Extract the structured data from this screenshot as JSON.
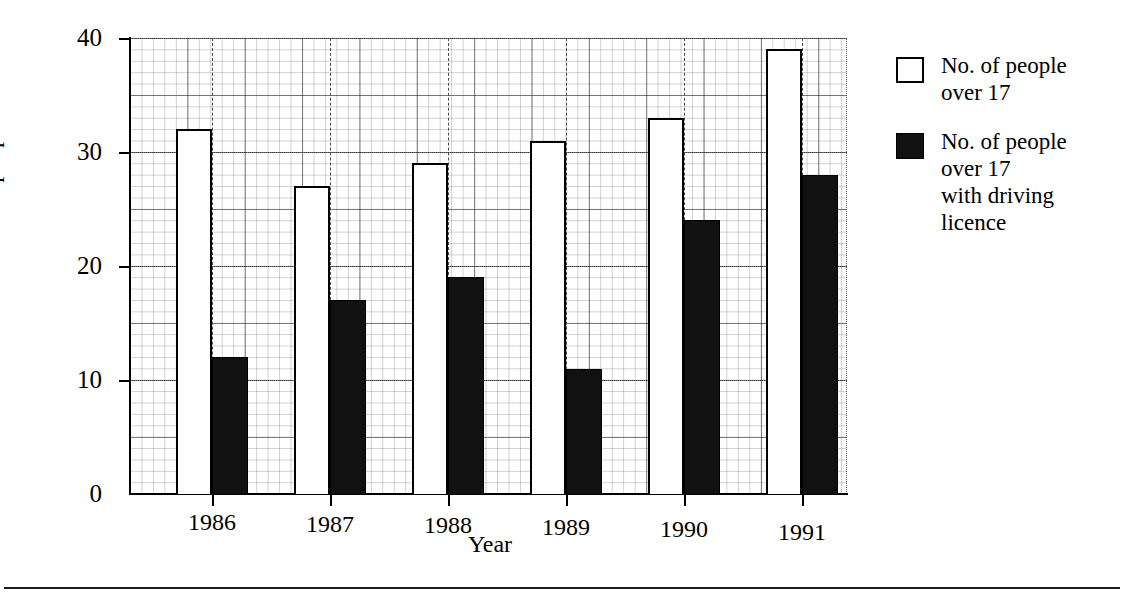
{
  "chart_data": {
    "type": "bar",
    "title": "",
    "xlabel": "Year",
    "ylabel": "No. of people",
    "categories": [
      "1986",
      "1987",
      "1988",
      "1989",
      "1990",
      "1991"
    ],
    "series": [
      {
        "name": "No. of people\nover 17",
        "fill": "white",
        "values": [
          32,
          27,
          29,
          31,
          33,
          39
        ]
      },
      {
        "name": "No. of people\nover 17\nwith driving\nlicence",
        "fill": "black",
        "values": [
          12,
          17,
          19,
          11,
          24,
          28
        ]
      }
    ],
    "ylim": [
      0,
      40
    ],
    "yticks": [
      "0",
      "10",
      "20",
      "30",
      "40"
    ],
    "ytick_values": [
      0,
      10,
      20,
      30,
      40
    ],
    "grid": true,
    "grid_minor_step": 1,
    "grid_major_step": 10,
    "legend_position": "right",
    "colors": {
      "outline": "#000000",
      "fill_dark": "#111111",
      "fill_light": "#ffffff",
      "grid_minor": "#787878",
      "grid_major": "#3a3a3a"
    }
  },
  "axes": {
    "y": {
      "label": "No. of people",
      "ticks": [
        {
          "label": "40",
          "value": 40
        },
        {
          "label": "30",
          "value": 30
        },
        {
          "label": "20",
          "value": 20
        },
        {
          "label": "10",
          "value": 10
        },
        {
          "label": "0",
          "value": 0
        }
      ]
    },
    "x": {
      "label": "Year",
      "ticks": [
        {
          "label": "1986"
        },
        {
          "label": "1987"
        },
        {
          "label": "1988"
        },
        {
          "label": "1989"
        },
        {
          "label": "1990"
        },
        {
          "label": "1991"
        }
      ]
    }
  },
  "legend": {
    "items": [
      {
        "swatch": "open",
        "label": "No. of people\nover 17"
      },
      {
        "swatch": "filled",
        "label": "No. of people\nover 17\nwith driving\nlicence"
      }
    ]
  }
}
